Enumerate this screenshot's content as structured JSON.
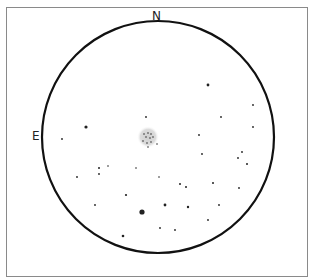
{
  "sketch": {
    "labels": {
      "north": "N",
      "east": "E"
    },
    "field": {
      "cx": 158,
      "cy": 137,
      "r": 116,
      "stroke": "#111111"
    },
    "nebula": {
      "cx": 148,
      "cy": 137,
      "r": 11,
      "color": "#d0d0d0"
    },
    "cluster_stars": [
      [
        144,
        134
      ],
      [
        148,
        133
      ],
      [
        151,
        134
      ],
      [
        146,
        137
      ],
      [
        150,
        138
      ],
      [
        153,
        137
      ],
      [
        143,
        141
      ],
      [
        147,
        143
      ],
      [
        151,
        142
      ],
      [
        157,
        144
      ],
      [
        148,
        147
      ]
    ],
    "stars": [
      [
        208,
        85,
        1.4
      ],
      [
        253,
        105,
        0.9
      ],
      [
        221,
        117,
        0.9
      ],
      [
        253,
        127,
        0.9
      ],
      [
        146,
        117,
        0.9
      ],
      [
        86,
        127,
        1.6
      ],
      [
        62,
        139,
        0.9
      ],
      [
        199,
        135,
        0.9
      ],
      [
        202,
        154,
        0.9
      ],
      [
        242,
        152,
        0.9
      ],
      [
        238,
        158,
        0.9
      ],
      [
        247,
        164,
        1.0
      ],
      [
        99,
        168,
        1.0
      ],
      [
        99,
        174,
        0.9
      ],
      [
        108,
        166,
        0.8
      ],
      [
        136,
        168,
        0.8
      ],
      [
        77,
        177,
        0.9
      ],
      [
        159,
        177,
        0.8
      ],
      [
        180,
        184,
        1.0
      ],
      [
        186,
        187,
        1.0
      ],
      [
        213,
        183,
        1.0
      ],
      [
        239,
        188,
        0.9
      ],
      [
        126,
        195,
        1.1
      ],
      [
        95,
        205,
        0.9
      ],
      [
        165,
        205,
        1.4
      ],
      [
        188,
        207,
        1.2
      ],
      [
        219,
        205,
        0.9
      ],
      [
        142,
        212,
        2.6
      ],
      [
        208,
        220,
        0.9
      ],
      [
        160,
        228,
        0.9
      ],
      [
        175,
        230,
        0.9
      ],
      [
        123,
        236,
        1.3
      ]
    ]
  }
}
